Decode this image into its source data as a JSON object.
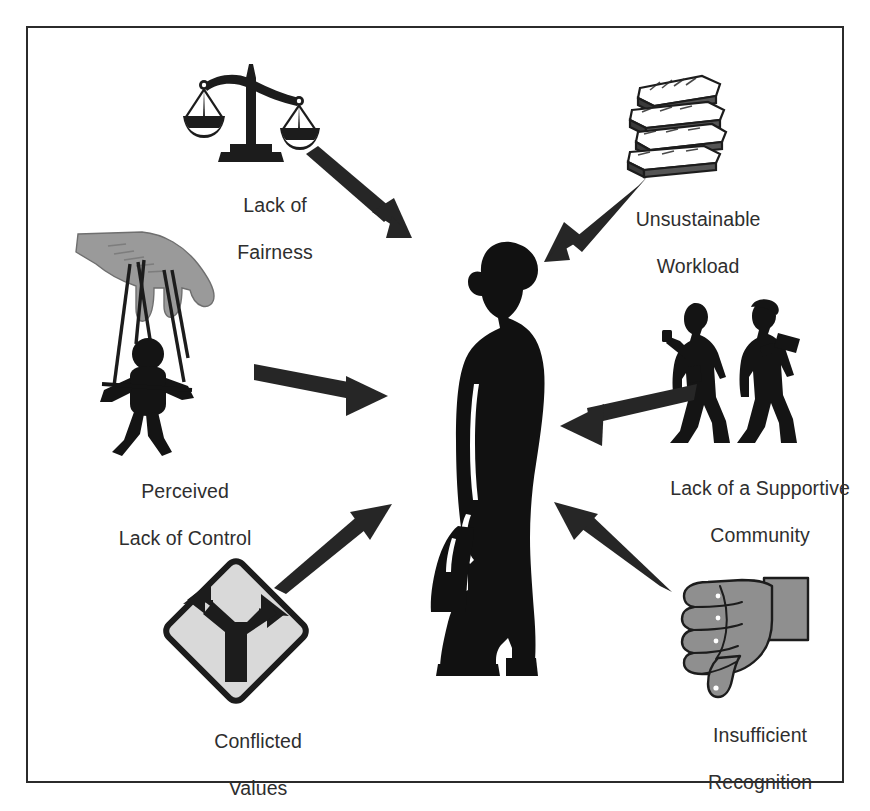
{
  "diagram": {
    "type": "hub-and-spoke",
    "center": {
      "name": "burnout-person-silhouette",
      "description": "Silhouette of a standing woman holding a bag",
      "color": "#111111"
    },
    "frame": {
      "border_color": "#2b2b2b",
      "background": "#ffffff"
    },
    "palette": {
      "ink": "#1a1a1a",
      "text": "#2e2e2e",
      "skin_gray": "#9a9a9a",
      "sign_fill": "#d9d9d9",
      "arrow": "#262626"
    },
    "nodes": [
      {
        "id": "lack-of-fairness",
        "icon": "scales-of-justice-icon",
        "label_line1": "Lack of",
        "label_line2": "Fairness",
        "position": "top-left",
        "arrow_direction": "down-right"
      },
      {
        "id": "unsustainable-workload",
        "icon": "stack-of-books-icon",
        "label_line1": "Unsustainable",
        "label_line2": "Workload",
        "position": "top-right",
        "arrow_direction": "down-left"
      },
      {
        "id": "perceived-lack-of-control",
        "icon": "marionette-puppet-icon",
        "label_line1": "Perceived",
        "label_line2": "Lack of Control",
        "position": "middle-left",
        "arrow_direction": "right"
      },
      {
        "id": "lack-of-supportive-community",
        "icon": "two-walking-people-icon",
        "label_line1": "Lack of a Supportive",
        "label_line2": "Community",
        "position": "middle-right",
        "arrow_direction": "left"
      },
      {
        "id": "conflicted-values",
        "icon": "fork-in-road-sign-icon",
        "label_line1": "Conflicted",
        "label_line2": "Values",
        "position": "bottom-left",
        "arrow_direction": "up-right"
      },
      {
        "id": "insufficient-recognition",
        "icon": "thumbs-down-icon",
        "label_line1": "Insufficient",
        "label_line2": "Recognition",
        "position": "bottom-right",
        "arrow_direction": "up-left"
      }
    ]
  }
}
